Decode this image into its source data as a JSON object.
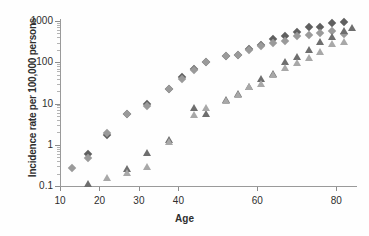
{
  "chart_data": {
    "type": "scatter",
    "title": "",
    "xlabel": "Age",
    "ylabel": "Incidence rate per 100,000 persons",
    "xlim": [
      10,
      85
    ],
    "ylim": [
      0.1,
      1000
    ],
    "yscale": "log",
    "xscale": "linear",
    "grid": false,
    "legend": "none",
    "xticks": [
      10,
      20,
      30,
      40,
      60,
      80
    ],
    "xtick_labels": [
      "10",
      "20",
      "30",
      "40",
      "60",
      "80"
    ],
    "yticks": [
      0.1,
      1,
      10,
      100,
      1000
    ],
    "ytick_labels": [
      "0.1",
      "1",
      "10",
      "100",
      "1000"
    ],
    "colors": {
      "dark_diamond": "#5f5f5f",
      "light_diamond": "#9a9a9a",
      "dark_triangle": "#6e6e6e",
      "light_triangle": "#a8a8a8",
      "axis": "#9a9a9a",
      "text": "#2e2e2e"
    },
    "series": [
      {
        "name": "dark-diamond",
        "marker": "diamond",
        "color": "#5f5f5f",
        "points": [
          [
            17,
            0.6
          ],
          [
            22,
            1.7
          ],
          [
            27,
            5.5
          ],
          [
            32,
            9.8
          ],
          [
            37.5,
            23
          ],
          [
            41,
            44
          ],
          [
            44,
            67
          ],
          [
            47,
            100
          ],
          [
            52,
            145
          ],
          [
            55,
            150
          ],
          [
            58,
            210
          ],
          [
            61,
            255
          ],
          [
            64,
            360
          ],
          [
            67,
            430
          ],
          [
            70,
            530
          ],
          [
            73,
            720
          ],
          [
            76,
            700
          ],
          [
            79,
            900
          ],
          [
            82,
            960
          ]
        ]
      },
      {
        "name": "light-diamond",
        "marker": "diamond",
        "color": "#9a9a9a",
        "points": [
          [
            13,
            0.27
          ],
          [
            17,
            0.47
          ],
          [
            22,
            1.95
          ],
          [
            27,
            5.5
          ],
          [
            32,
            8.6
          ],
          [
            37.5,
            22
          ],
          [
            41,
            40
          ],
          [
            44,
            65
          ],
          [
            47,
            100
          ],
          [
            52,
            142
          ],
          [
            55,
            150
          ],
          [
            58,
            200
          ],
          [
            61,
            245
          ],
          [
            64,
            300
          ],
          [
            67,
            330
          ],
          [
            70,
            430
          ],
          [
            73,
            470
          ],
          [
            76,
            520
          ],
          [
            79,
            560
          ],
          [
            82,
            480
          ]
        ]
      },
      {
        "name": "dark-triangle",
        "marker": "triangle",
        "color": "#6e6e6e",
        "points": [
          [
            17,
            0.12
          ],
          [
            27,
            0.28
          ],
          [
            32,
            0.68
          ],
          [
            37.5,
            1.35
          ],
          [
            44,
            8.2
          ],
          [
            47,
            5.8
          ],
          [
            52,
            13
          ],
          [
            55,
            18
          ],
          [
            58,
            26
          ],
          [
            61,
            42
          ],
          [
            64,
            56
          ],
          [
            67,
            105
          ],
          [
            70,
            140
          ],
          [
            73,
            215
          ],
          [
            76,
            330
          ],
          [
            79,
            430
          ],
          [
            82,
            620
          ],
          [
            84,
            700
          ]
        ]
      },
      {
        "name": "light-triangle",
        "marker": "triangle",
        "color": "#a8a8a8",
        "points": [
          [
            27,
            0.22
          ],
          [
            22,
            0.165
          ],
          [
            32,
            0.3
          ],
          [
            37.5,
            1.25
          ],
          [
            44,
            5.6
          ],
          [
            47,
            8.0
          ],
          [
            52,
            12
          ],
          [
            55,
            17
          ],
          [
            58,
            27
          ],
          [
            61,
            32
          ],
          [
            64,
            53
          ],
          [
            67,
            78
          ],
          [
            70,
            100
          ],
          [
            73,
            135
          ],
          [
            76,
            190
          ],
          [
            79,
            300
          ],
          [
            82,
            330
          ]
        ]
      }
    ]
  },
  "axis": {
    "x_title": "Age",
    "y_title": "Incidence rate per 100,000 persons"
  }
}
